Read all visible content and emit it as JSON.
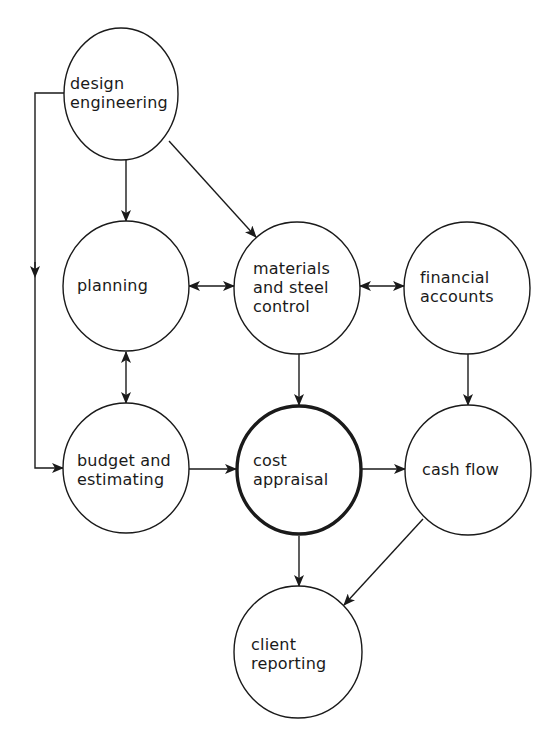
{
  "diagram": {
    "type": "flow",
    "colors": {
      "stroke": "#1a1a1a",
      "background": "#ffffff"
    },
    "nodes": [
      {
        "id": "design",
        "label": "design\nengineering",
        "cx": 121,
        "cy": 94,
        "rx": 57,
        "ry": 66,
        "emphasis": false
      },
      {
        "id": "planning",
        "label": "planning",
        "cx": 126,
        "cy": 286,
        "rx": 63,
        "ry": 65,
        "emphasis": false
      },
      {
        "id": "materials",
        "label": "materials\nand steel\ncontrol",
        "cx": 297,
        "cy": 288,
        "rx": 63,
        "ry": 66,
        "emphasis": false
      },
      {
        "id": "financial",
        "label": "financial\naccounts",
        "cx": 467,
        "cy": 288,
        "rx": 63,
        "ry": 66,
        "emphasis": false
      },
      {
        "id": "budget",
        "label": "budget and\nestimating",
        "cx": 126,
        "cy": 468,
        "rx": 63,
        "ry": 65,
        "emphasis": false
      },
      {
        "id": "cost",
        "label": "cost\nappraisal",
        "cx": 299,
        "cy": 470,
        "rx": 63,
        "ry": 65,
        "emphasis": true
      },
      {
        "id": "cashflow",
        "label": "cash flow",
        "cx": 468,
        "cy": 470,
        "rx": 63,
        "ry": 65,
        "emphasis": false
      },
      {
        "id": "client",
        "label": "client\nreporting",
        "cx": 298,
        "cy": 652,
        "rx": 64,
        "ry": 66,
        "emphasis": false
      }
    ],
    "edges": [
      {
        "from": "design",
        "to": "planning",
        "bidirectional": false
      },
      {
        "from": "design",
        "to": "materials",
        "bidirectional": false
      },
      {
        "from": "design",
        "to": "budget",
        "bidirectional": false,
        "route": "left-bypass"
      },
      {
        "from": "planning",
        "to": "materials",
        "bidirectional": true
      },
      {
        "from": "materials",
        "to": "financial",
        "bidirectional": true
      },
      {
        "from": "planning",
        "to": "budget",
        "bidirectional": true
      },
      {
        "from": "materials",
        "to": "cost",
        "bidirectional": false
      },
      {
        "from": "financial",
        "to": "cashflow",
        "bidirectional": false
      },
      {
        "from": "budget",
        "to": "cost",
        "bidirectional": false
      },
      {
        "from": "cost",
        "to": "cashflow",
        "bidirectional": false
      },
      {
        "from": "cost",
        "to": "client",
        "bidirectional": false
      },
      {
        "from": "cashflow",
        "to": "client",
        "bidirectional": false
      }
    ]
  },
  "labels": {
    "design": "design\nengineering",
    "planning": "planning",
    "materials": "materials\nand steel\ncontrol",
    "financial": "financial\naccounts",
    "budget": "budget and\nestimating",
    "cost": "cost\nappraisal",
    "cashflow": "cash flow",
    "client": "client\nreporting"
  }
}
